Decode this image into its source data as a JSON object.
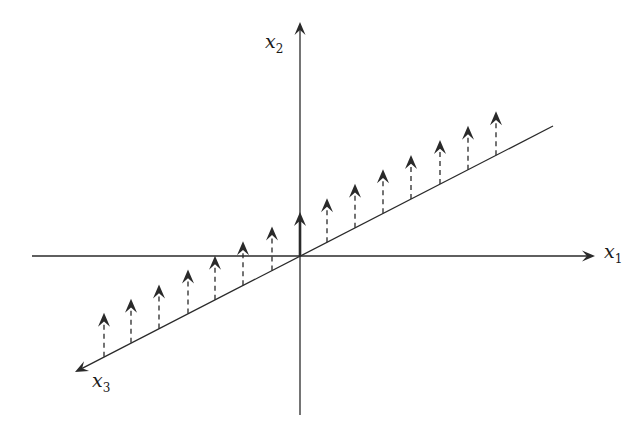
{
  "diagram": {
    "type": "3d-axes-vector-field",
    "colors": {
      "line": "#2a2a2a",
      "background": "#ffffff"
    },
    "origin": [
      300,
      256
    ],
    "axes": [
      {
        "id": "x1",
        "label_main": "x",
        "label_sub": "1",
        "from": [
          32,
          256
        ],
        "to": [
          595,
          256
        ],
        "arrow": true,
        "label_pos": [
          604,
          248
        ]
      },
      {
        "id": "x2",
        "label_main": "x",
        "label_sub": "2",
        "from": [
          300,
          415
        ],
        "to": [
          300,
          22
        ],
        "arrow": true,
        "label_pos": [
          265,
          38
        ]
      },
      {
        "id": "x3",
        "label_main": "x",
        "label_sub": "3",
        "from": [
          553,
          126
        ],
        "to": [
          75,
          372
        ],
        "arrow": true,
        "label_pos": [
          92,
          377
        ]
      }
    ],
    "vector_length": 44,
    "vectors": [
      {
        "x": 104,
        "style": "dashed"
      },
      {
        "x": 131,
        "style": "dashed"
      },
      {
        "x": 159,
        "style": "dashed"
      },
      {
        "x": 188,
        "style": "dashed"
      },
      {
        "x": 215,
        "style": "dashed"
      },
      {
        "x": 243,
        "style": "dashed"
      },
      {
        "x": 272,
        "style": "dashed"
      },
      {
        "x": 300,
        "style": "solid"
      },
      {
        "x": 327,
        "style": "dashed"
      },
      {
        "x": 355,
        "style": "dashed"
      },
      {
        "x": 383,
        "style": "dashed"
      },
      {
        "x": 411,
        "style": "dashed"
      },
      {
        "x": 440,
        "style": "dashed"
      },
      {
        "x": 468,
        "style": "dashed"
      },
      {
        "x": 496,
        "style": "dashed"
      }
    ]
  }
}
